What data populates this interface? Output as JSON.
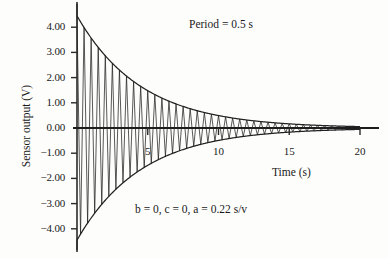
{
  "chart_data": {
    "type": "line",
    "title": "",
    "xlabel": "Time   (s)",
    "ylabel": "Sensor output (V)",
    "xlim": [
      0,
      20
    ],
    "ylim": [
      -4.4,
      4.4
    ],
    "grid": false,
    "legend": null,
    "x_ticks": [
      {
        "value": 5,
        "label": "5"
      },
      {
        "value": 10,
        "label": "10"
      },
      {
        "value": 15,
        "label": "15"
      },
      {
        "value": 20,
        "label": "20"
      }
    ],
    "y_ticks": [
      {
        "value": 4,
        "label": "4.00"
      },
      {
        "value": 3,
        "label": "3.00"
      },
      {
        "value": 2,
        "label": "2.00"
      },
      {
        "value": 1,
        "label": "1.00"
      },
      {
        "value": 0,
        "label": "0.00"
      },
      {
        "value": -1,
        "label": "−1.00"
      },
      {
        "value": -2,
        "label": "−2.00"
      },
      {
        "value": -3,
        "label": "−3.00"
      },
      {
        "value": -4,
        "label": "−4.00"
      }
    ],
    "annotations": [
      {
        "name": "period",
        "text": "Period = 0.5 s",
        "x": 8.1,
        "y": 3.85
      },
      {
        "name": "params",
        "text": "b = 0, c = 0, a = 0.22 s/v",
        "x": 4.3,
        "y": -3.1
      }
    ],
    "series": [
      {
        "name": "damped oscillation",
        "kind": "damped_sine",
        "amplitude": 4.45,
        "decay_rate": 0.22,
        "period": 0.5,
        "offset": 0.0,
        "color": "#222222"
      },
      {
        "name": "upper envelope",
        "kind": "envelope",
        "sign": 1,
        "amplitude": 4.45,
        "decay_rate": 0.22,
        "color": "#222222"
      },
      {
        "name": "lower envelope",
        "kind": "envelope",
        "sign": -1,
        "amplitude": 4.45,
        "decay_rate": 0.22,
        "color": "#222222"
      }
    ],
    "sampled_envelope": {
      "t": [
        0,
        1,
        2,
        3,
        4,
        5,
        6,
        7,
        8,
        9,
        10,
        11,
        12,
        13,
        14,
        15,
        16,
        17,
        18,
        19,
        20
      ],
      "amplitude": [
        4.45,
        3.57,
        2.87,
        2.3,
        1.85,
        1.48,
        1.19,
        0.95,
        0.77,
        0.62,
        0.49,
        0.4,
        0.32,
        0.26,
        0.21,
        0.17,
        0.13,
        0.11,
        0.09,
        0.07,
        0.05
      ]
    }
  },
  "axis": {
    "x_axis_name": "time-axis",
    "y_axis_name": "sensor-output-axis"
  }
}
